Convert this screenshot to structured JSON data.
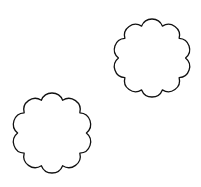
{
  "canvas": {
    "width": 201,
    "height": 187,
    "background": "#ffffff"
  },
  "shapes": [
    {
      "name": "scalloped-shape-top-right",
      "type": "scalloped-circle",
      "cx": 152,
      "cy": 58,
      "r": 39,
      "lobes": 10,
      "stroke": "#111111",
      "fill": "#ffffff"
    },
    {
      "name": "scalloped-shape-bottom-left",
      "type": "scalloped-circle",
      "cx": 52,
      "cy": 133,
      "r": 40,
      "lobes": 10,
      "stroke": "#111111",
      "fill": "#ffffff"
    }
  ]
}
